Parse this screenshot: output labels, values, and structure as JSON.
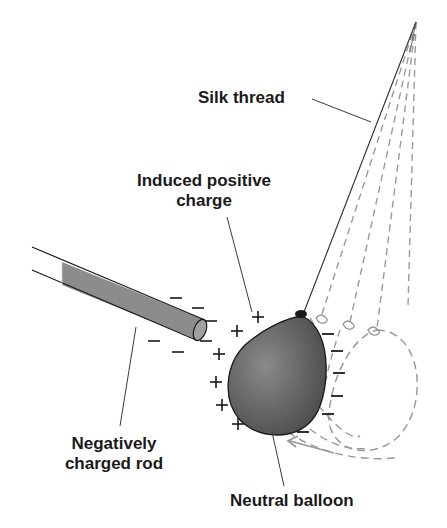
{
  "diagram": {
    "labels": {
      "silk_thread": "Silk thread",
      "induced_line1": "Induced positive",
      "induced_line2": "charge",
      "rod_line1": "Negatively",
      "rod_line2": "charged rod",
      "balloon": "Neutral balloon"
    },
    "signs": {
      "plus": "+",
      "minus": "−"
    },
    "rod_charges": {
      "sign": "−",
      "count": 7
    },
    "balloon_near_side_charges": {
      "sign": "+",
      "count": 7
    },
    "balloon_far_side_charges": {
      "sign": "−",
      "count": 7
    },
    "ghost_positions": 3,
    "colors": {
      "ink": "#1a1a1a",
      "rod_fill": "#8c8c8c",
      "balloon_fill": "#5a5a5a",
      "balloon_highlight": "#8a8a8a",
      "dashed": "#9a9a9a",
      "arrow": "#9a9a9a"
    }
  }
}
